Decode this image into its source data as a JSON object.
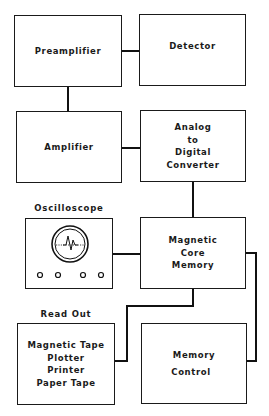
{
  "diagram": {
    "type": "block-diagram",
    "blocks": {
      "preamplifier": {
        "lines": [
          "Preamplifier"
        ]
      },
      "detector": {
        "lines": [
          "Detector"
        ]
      },
      "amplifier": {
        "lines": [
          "Amplifier"
        ]
      },
      "adc": {
        "lines": [
          "Analog",
          "to",
          "Digital",
          "Converter"
        ]
      },
      "oscilloscope": {
        "label": "Oscilloscope",
        "knobs": 4
      },
      "memory": {
        "lines": [
          "Magnetic",
          "Core",
          "Memory"
        ]
      },
      "readout": {
        "label": "Read Out",
        "lines": [
          "Magnetic Tape",
          "Plotter",
          "Printer",
          "Paper Tape"
        ]
      },
      "memory_control": {
        "lines": [
          "Memory",
          "Control"
        ]
      }
    },
    "connections": [
      [
        "preamplifier",
        "detector"
      ],
      [
        "preamplifier",
        "amplifier"
      ],
      [
        "amplifier",
        "adc"
      ],
      [
        "adc",
        "memory"
      ],
      [
        "oscilloscope",
        "memory"
      ],
      [
        "memory",
        "readout"
      ],
      [
        "memory",
        "memory_control"
      ]
    ]
  }
}
